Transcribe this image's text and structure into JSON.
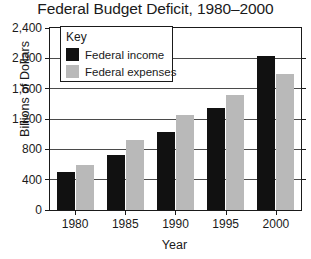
{
  "chart_data": {
    "type": "bar",
    "title": "Federal Budget Deficit, 1980–2000",
    "xlabel": "Year",
    "ylabel": "Billions of Dollars",
    "categories": [
      "1980",
      "1985",
      "1990",
      "1995",
      "2000"
    ],
    "series": [
      {
        "name": "Federal income",
        "color": "#111111",
        "values": [
          500,
          730,
          1030,
          1350,
          2030
        ]
      },
      {
        "name": "Federal expenses",
        "color": "#b9b9b9",
        "values": [
          600,
          920,
          1250,
          1520,
          1800
        ]
      }
    ],
    "ylim": [
      0,
      2400
    ],
    "yticks": [
      0,
      400,
      800,
      1200,
      1600,
      2000,
      2400
    ],
    "ytick_labels": [
      "0",
      "400",
      "800",
      "1,200",
      "1,600",
      "2,000",
      "2,400"
    ],
    "grid": true,
    "legend_position": "top-left",
    "legend_title": "Key"
  }
}
